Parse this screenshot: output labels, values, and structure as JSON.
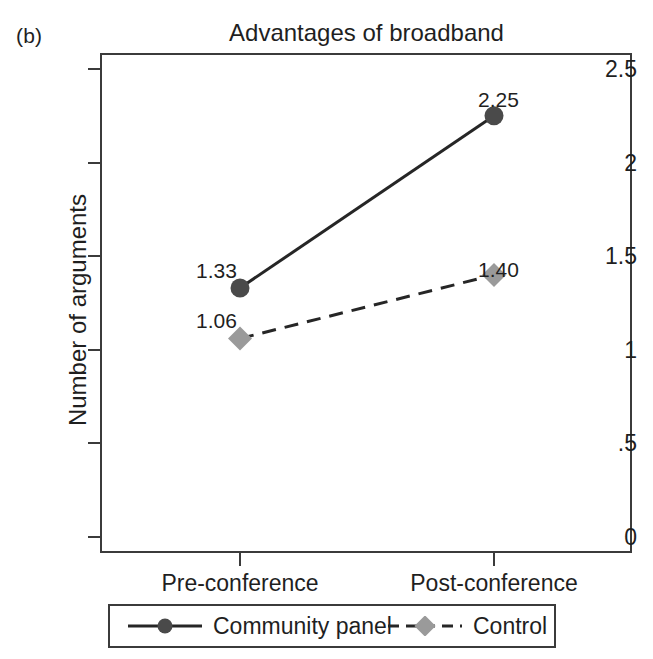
{
  "figure": {
    "panel_label": "(b)"
  },
  "chart_data": {
    "type": "line",
    "title": "Advantages of broadband",
    "xlabel": "",
    "ylabel": "Number of arguments",
    "categories": [
      "Pre-conference",
      "Post-conference"
    ],
    "ylim": [
      0,
      2.5
    ],
    "yticks": [
      "0",
      ".5",
      "1",
      "1.5",
      "2",
      "2.5"
    ],
    "ytick_values": [
      0,
      0.5,
      1,
      1.5,
      2,
      2.5
    ],
    "grid": false,
    "legend_position": "bottom",
    "series": [
      {
        "name": "Community panel",
        "values": [
          1.33,
          2.25
        ],
        "labels": [
          "1.33",
          "2.25"
        ],
        "color": "#4a4a4a",
        "line_color": "#262626",
        "line_style": "solid",
        "marker": "circle"
      },
      {
        "name": "Control",
        "values": [
          1.06,
          1.4
        ],
        "labels": [
          "1.06",
          "1.40"
        ],
        "color": "#9a9a9a",
        "line_color": "#262626",
        "line_style": "dashed",
        "marker": "diamond"
      }
    ]
  }
}
